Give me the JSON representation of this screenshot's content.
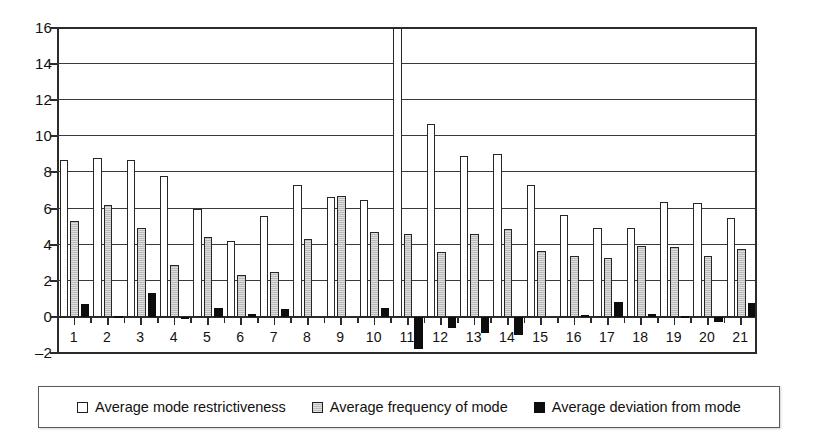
{
  "chart_data": {
    "type": "bar",
    "title": "",
    "subtitle": "",
    "xlabel": "",
    "ylabel": "",
    "ylim": [
      -2,
      16
    ],
    "ytick_step": 2,
    "yticks": [
      -2,
      0,
      2,
      4,
      6,
      8,
      10,
      12,
      14,
      16
    ],
    "grid": true,
    "grid_axis": "y",
    "legend_position": "bottom",
    "categories": [
      "1",
      "2",
      "3",
      "4",
      "5",
      "6",
      "7",
      "8",
      "9",
      "10",
      "11",
      "12",
      "13",
      "14",
      "15",
      "16",
      "17",
      "18",
      "19",
      "20",
      "21"
    ],
    "series": [
      {
        "name": "Average mode restrictiveness",
        "color": "#ffffff",
        "edge_color": "#262626",
        "values": [
          8.7,
          8.8,
          8.7,
          7.8,
          6.0,
          4.2,
          5.6,
          7.3,
          6.65,
          6.5,
          16.1,
          10.7,
          8.9,
          9.0,
          7.3,
          5.65,
          4.95,
          4.95,
          6.35,
          6.3,
          5.45
        ],
        "clipped_points": [
          {
            "category": "11",
            "note": "bar extends above axis maximum"
          }
        ]
      },
      {
        "name": "Average frequency of mode",
        "color": "#bdbdbd",
        "edge_color": "#262626",
        "values": [
          5.3,
          6.2,
          4.9,
          2.9,
          4.4,
          2.3,
          2.5,
          4.3,
          6.7,
          4.7,
          4.6,
          3.6,
          4.6,
          4.85,
          3.65,
          3.4,
          3.25,
          3.9,
          3.85,
          3.4,
          3.75
        ]
      },
      {
        "name": "Average deviation from mode",
        "color": "#0d0d0d",
        "edge_color": "#0d0d0d",
        "values": [
          0.7,
          0.05,
          1.3,
          -0.1,
          0.5,
          0.15,
          0.45,
          0.0,
          0.0,
          0.5,
          -1.8,
          -0.6,
          -0.9,
          -1.0,
          0.0,
          0.1,
          0.8,
          0.15,
          0.05,
          -0.3,
          0.75
        ]
      }
    ]
  },
  "legend": {
    "items": [
      {
        "label": "Average mode restrictiveness",
        "swatch": "white-square-swatch"
      },
      {
        "label": "Average frequency of mode",
        "swatch": "gray-square-swatch"
      },
      {
        "label": "Average deviation from mode",
        "swatch": "black-square-swatch"
      }
    ]
  }
}
